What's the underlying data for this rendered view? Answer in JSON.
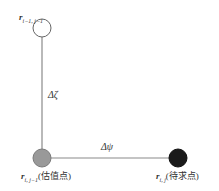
{
  "diagram": {
    "nodes": [
      {
        "id": "top",
        "var": "r",
        "sub": "i−1, j−1",
        "suffix": "",
        "fill": "#ffffff",
        "stroke": "#666666"
      },
      {
        "id": "estimate",
        "var": "r",
        "sub": "i, j−1",
        "suffix": "(估值点)",
        "fill": "#999999",
        "stroke": "#777777"
      },
      {
        "id": "target",
        "var": "r",
        "sub": "i, j",
        "suffix": "(待求点)",
        "fill": "#1a1a1a",
        "stroke": "#111111"
      }
    ],
    "edges": [
      {
        "from": "top",
        "to": "estimate",
        "label": "Δζ",
        "color": "#888888"
      },
      {
        "from": "estimate",
        "to": "target",
        "label": "Δψ",
        "color": "#888888"
      }
    ]
  }
}
